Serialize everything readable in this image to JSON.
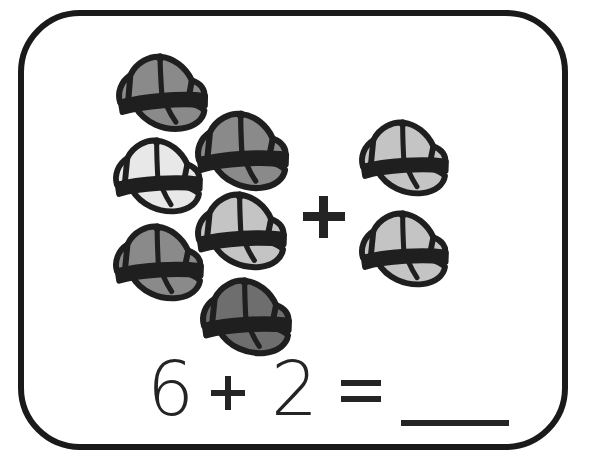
{
  "card": {
    "border_color": "#1a1a1a",
    "background_color": "#ffffff"
  },
  "problem": {
    "type": "addition-picture-problem",
    "subject_icon": "baseball-cap-icon",
    "left_group_count": 6,
    "right_group_count": 2,
    "total": 8,
    "group_operator": "+"
  },
  "equation": {
    "addend_one": "6",
    "plus": "+",
    "addend_two": "2",
    "equals": "=",
    "answer": "",
    "answer_blank_label": "___",
    "text": "6 + 2 = ___"
  },
  "colors": {
    "ink": "#242424",
    "outline": "#1f1f1f",
    "cap_medium_gray": "#8a8a8a",
    "cap_dark_gray": "#6e6e6e",
    "cap_light_gray": "#e8e8e8",
    "cap_mid_light_gray": "#c4c4c4",
    "cap_pale_gray": "#d2d2d2"
  },
  "left_group": {
    "label": "Group of six caps",
    "caps": [
      {
        "id": "cap-1",
        "fill": "#8a8a8a",
        "x": 84,
        "y": 34,
        "w": 104,
        "h": 86,
        "rotate": -4
      },
      {
        "id": "cap-2",
        "fill": "#8a8a8a",
        "x": 163,
        "y": 91,
        "w": 106,
        "h": 88,
        "rotate": -3
      },
      {
        "id": "cap-3",
        "fill": "#e8e8e8",
        "x": 81,
        "y": 118,
        "w": 102,
        "h": 84,
        "rotate": -3
      },
      {
        "id": "cap-4",
        "fill": "#c4c4c4",
        "x": 163,
        "y": 172,
        "w": 104,
        "h": 86,
        "rotate": -3
      },
      {
        "id": "cap-5",
        "fill": "#8a8a8a",
        "x": 81,
        "y": 204,
        "w": 103,
        "h": 85,
        "rotate": -3
      },
      {
        "id": "cap-6",
        "fill": "#6e6e6e",
        "x": 168,
        "y": 258,
        "w": 104,
        "h": 86,
        "rotate": -3
      }
    ]
  },
  "right_group": {
    "label": "Group of two caps",
    "caps": [
      {
        "id": "cap-7",
        "fill": "#c4c4c4",
        "x": 327,
        "y": 100,
        "w": 102,
        "h": 84,
        "rotate": -3
      },
      {
        "id": "cap-8",
        "fill": "#c4c4c4",
        "x": 327,
        "y": 191,
        "w": 102,
        "h": 84,
        "rotate": -3
      }
    ]
  }
}
